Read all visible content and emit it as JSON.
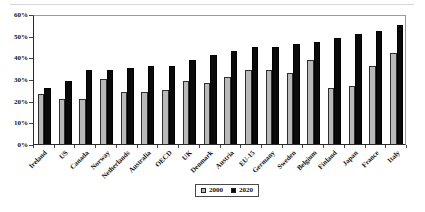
{
  "chart_data": {
    "type": "bar",
    "title": "",
    "categories": [
      "Ireland",
      "US",
      "Canada",
      "Norway",
      "Netherlands",
      "Australia",
      "OECD",
      "UK",
      "Denmark",
      "Austria",
      "EU-15",
      "Germany",
      "Sweden",
      "Belgium",
      "Finland",
      "Japan",
      "France",
      "Italy"
    ],
    "series": [
      {
        "name": "2000",
        "color": "#b9b9b9",
        "values": [
          23,
          21,
          21,
          30,
          24,
          24,
          25,
          29,
          28,
          31,
          34,
          34,
          33,
          39,
          26,
          27,
          36,
          42
        ]
      },
      {
        "name": "2020",
        "color": "#0a0a0a",
        "values": [
          26,
          29,
          34,
          34,
          35,
          36,
          36,
          39,
          41,
          43,
          45,
          45,
          46,
          47,
          49,
          51,
          52,
          55
        ]
      }
    ],
    "xlabel": "",
    "ylabel": "",
    "ylim": [
      0,
      60
    ],
    "ytick_labels": [
      "0%",
      "10%",
      "20%",
      "30%",
      "40%",
      "50%",
      "60%"
    ],
    "grid": false,
    "legend_position": "bottom-center"
  }
}
